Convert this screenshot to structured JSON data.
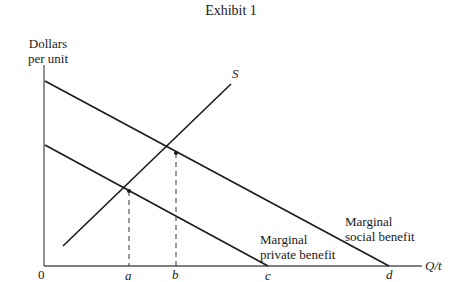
{
  "title": "Exhibit 1",
  "axes": {
    "y_label_line1": "Dollars",
    "y_label_line2": "per unit",
    "x_label": "Q/t",
    "origin": "0"
  },
  "curves": {
    "supply": {
      "label": "S"
    },
    "mpb": {
      "label_line1": "Marginal",
      "label_line2": "private benefit"
    },
    "msb": {
      "label_line1": "Marginal",
      "label_line2": "social benefit"
    }
  },
  "x_ticks": [
    "a",
    "b",
    "c",
    "d"
  ],
  "colors": {
    "line": "#1a1a1a",
    "axis": "#555555"
  }
}
